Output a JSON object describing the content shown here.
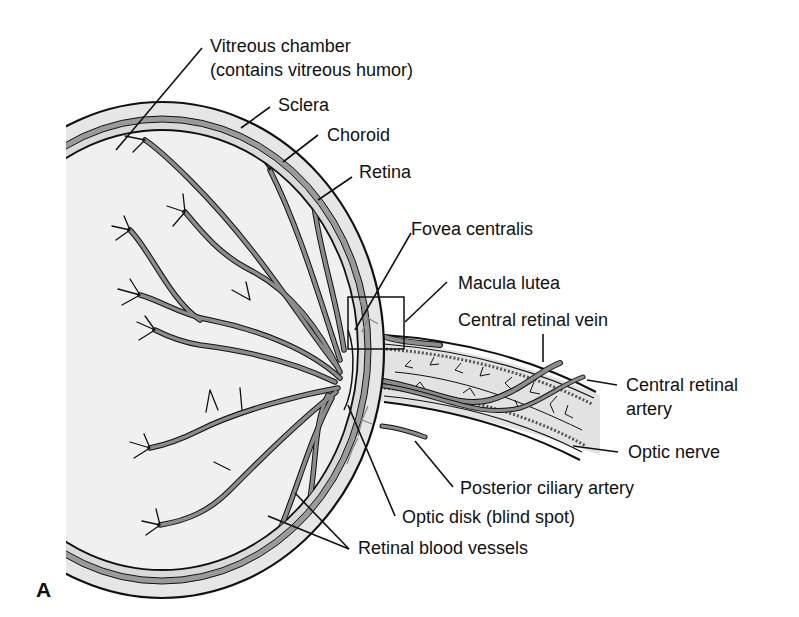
{
  "figure": {
    "panel_label": "A"
  },
  "labels": {
    "vitreous_chamber": "Vitreous chamber",
    "vitreous_chamber_sub": "(contains vitreous humor)",
    "sclera": "Sclera",
    "choroid": "Choroid",
    "retina": "Retina",
    "fovea_centralis": "Fovea centralis",
    "macula_lutea": "Macula lutea",
    "central_retinal_vein": "Central retinal vein",
    "central_retinal_artery_1": "Central retinal",
    "central_retinal_artery_2": "artery",
    "optic_nerve": "Optic nerve",
    "posterior_ciliary_artery": "Posterior ciliary artery",
    "optic_disk": "Optic disk (blind spot)",
    "retinal_blood_vessels": "Retinal blood vessels"
  },
  "colors": {
    "outline": "#111111",
    "sclera_fill": "#e6e6e6",
    "choroid_fill": "#9a9a9a",
    "retina_fill": "#dadada",
    "interior_fill": "#f0f0f0",
    "vessel_fill": "#8c8c8c",
    "nerve_fill": "#e2e2e2"
  }
}
